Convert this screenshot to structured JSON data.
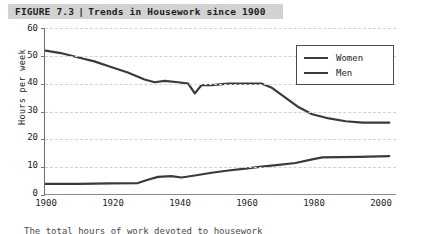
{
  "figure": {
    "label": "FIGURE 7.3",
    "separator": "|",
    "title": "Trends in Housework since 1900",
    "banner_color": "#d2d2d2",
    "caption": "The total hours of work devoted to housework"
  },
  "legend": {
    "position": "top-right",
    "entries": [
      {
        "name": "Women",
        "color": "#3a3a3a"
      },
      {
        "name": "Men",
        "color": "#3a3a3a"
      }
    ]
  },
  "axis": {
    "y_label": "Hours per week",
    "y_ticks": [
      "60",
      "50",
      "40",
      "30",
      "20",
      "10",
      "0"
    ],
    "x_ticks": [
      "1900",
      "1920",
      "1940",
      "1960",
      "1980",
      "2000"
    ]
  },
  "chart_data": {
    "type": "line",
    "title": "Trends in Housework since 1900",
    "xlabel": "",
    "ylabel": "Hours per week",
    "xlim": [
      1900,
      2005
    ],
    "ylim": [
      0,
      60
    ],
    "ytick_step": 10,
    "xtick_step": 20,
    "grid": true,
    "grid_style": "dashed-horizontal",
    "legend_position": "top-right",
    "series": [
      {
        "name": "Women",
        "color": "#3a3a3a",
        "x": [
          1900,
          1905,
          1910,
          1915,
          1920,
          1925,
          1930,
          1933,
          1936,
          1940,
          1943,
          1945,
          1947,
          1950,
          1955,
          1960,
          1965,
          1968,
          1972,
          1976,
          1980,
          1985,
          1990,
          1995,
          2000,
          2003
        ],
        "values": [
          52.0,
          51.0,
          49.5,
          48.0,
          46.0,
          44.0,
          41.5,
          40.5,
          41.0,
          40.5,
          40.0,
          36.5,
          39.5,
          39.5,
          40.0,
          40.0,
          40.0,
          38.5,
          35.0,
          31.5,
          29.0,
          27.5,
          26.5,
          26.0,
          26.0,
          26.0
        ]
      },
      {
        "name": "Men",
        "color": "#3a3a3a",
        "x": [
          1900,
          1910,
          1920,
          1928,
          1931,
          1934,
          1938,
          1941,
          1945,
          1950,
          1955,
          1960,
          1965,
          1970,
          1975,
          1980,
          1983,
          1988,
          1994,
          2000,
          2003
        ],
        "values": [
          4.0,
          4.0,
          4.2,
          4.3,
          5.5,
          6.5,
          6.8,
          6.3,
          7.0,
          8.0,
          8.8,
          9.5,
          10.2,
          10.8,
          11.5,
          12.8,
          13.5,
          13.6,
          13.7,
          13.9,
          14.0
        ]
      }
    ]
  }
}
